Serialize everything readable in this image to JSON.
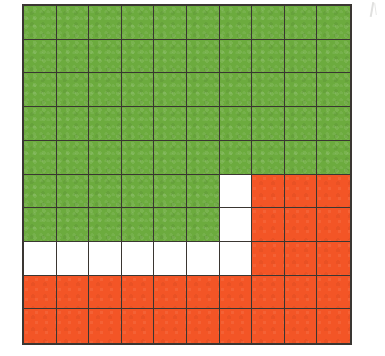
{
  "figure": {
    "type": "grid-area-model",
    "rows": 10,
    "columns": 10,
    "total_cells": 100,
    "colors": {
      "green": "#6cab3e",
      "orange": "#f35526",
      "white": "#ffffff",
      "gridline": "#3a3632",
      "background": "#ffffff"
    },
    "counts": {
      "green": 66,
      "orange": 24,
      "white": 10
    },
    "legend_note": "",
    "cells": [
      [
        "green",
        "green",
        "green",
        "green",
        "green",
        "green",
        "green",
        "green",
        "green",
        "green"
      ],
      [
        "green",
        "green",
        "green",
        "green",
        "green",
        "green",
        "green",
        "green",
        "green",
        "green"
      ],
      [
        "green",
        "green",
        "green",
        "green",
        "green",
        "green",
        "green",
        "green",
        "green",
        "green"
      ],
      [
        "green",
        "green",
        "green",
        "green",
        "green",
        "green",
        "green",
        "green",
        "green",
        "green"
      ],
      [
        "green",
        "green",
        "green",
        "green",
        "green",
        "green",
        "green",
        "green",
        "green",
        "green"
      ],
      [
        "green",
        "green",
        "green",
        "green",
        "green",
        "green",
        "white",
        "orange",
        "orange",
        "orange"
      ],
      [
        "green",
        "green",
        "green",
        "green",
        "green",
        "green",
        "white",
        "orange",
        "orange",
        "orange"
      ],
      [
        "white",
        "white",
        "white",
        "white",
        "white",
        "white",
        "white",
        "orange",
        "orange",
        "orange"
      ],
      [
        "orange",
        "orange",
        "orange",
        "orange",
        "orange",
        "orange",
        "orange",
        "orange",
        "orange",
        "orange"
      ],
      [
        "orange",
        "orange",
        "orange",
        "orange",
        "orange",
        "orange",
        "orange",
        "orange",
        "orange",
        "orange"
      ]
    ]
  },
  "chart_data": {
    "type": "heatmap",
    "title": "",
    "xlabel": "",
    "ylabel": "",
    "categories": [
      "1",
      "2",
      "3",
      "4",
      "5",
      "6",
      "7",
      "8",
      "9",
      "10"
    ],
    "row_labels": [
      "1",
      "2",
      "3",
      "4",
      "5",
      "6",
      "7",
      "8",
      "9",
      "10"
    ],
    "grid": true,
    "legend_position": "none",
    "value_map": {
      "green": 1,
      "white": 0,
      "orange": 2
    },
    "series": [
      {
        "name": "green",
        "values": 66
      },
      {
        "name": "white",
        "values": 10
      },
      {
        "name": "orange",
        "values": 24
      }
    ],
    "values": [
      [
        1,
        1,
        1,
        1,
        1,
        1,
        1,
        1,
        1,
        1
      ],
      [
        1,
        1,
        1,
        1,
        1,
        1,
        1,
        1,
        1,
        1
      ],
      [
        1,
        1,
        1,
        1,
        1,
        1,
        1,
        1,
        1,
        1
      ],
      [
        1,
        1,
        1,
        1,
        1,
        1,
        1,
        1,
        1,
        1
      ],
      [
        1,
        1,
        1,
        1,
        1,
        1,
        1,
        1,
        1,
        1
      ],
      [
        1,
        1,
        1,
        1,
        1,
        1,
        0,
        2,
        2,
        2
      ],
      [
        1,
        1,
        1,
        1,
        1,
        1,
        0,
        2,
        2,
        2
      ],
      [
        0,
        0,
        0,
        0,
        0,
        0,
        0,
        2,
        2,
        2
      ],
      [
        2,
        2,
        2,
        2,
        2,
        2,
        2,
        2,
        2,
        2
      ],
      [
        2,
        2,
        2,
        2,
        2,
        2,
        2,
        2,
        2,
        2
      ]
    ]
  }
}
